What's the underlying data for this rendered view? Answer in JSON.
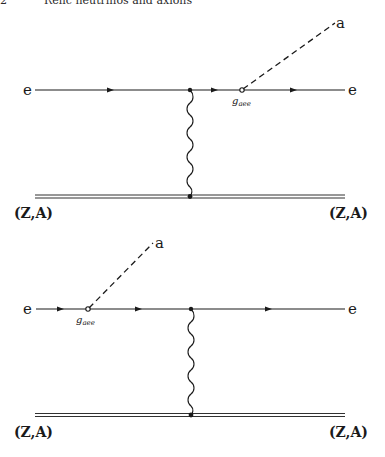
{
  "header": {
    "page_number": "2",
    "running_title": "Relic neutrinos and axions"
  },
  "diagrams": [
    {
      "id": "axion-emission-final-state",
      "incoming_electron": "e",
      "outgoing_electron": "e",
      "axion": "a",
      "coupling": "g",
      "coupling_sub": "aee",
      "nucleus_in": "(Z,A)",
      "nucleus_out": "(Z,A)"
    },
    {
      "id": "axion-emission-initial-state",
      "incoming_electron": "e",
      "outgoing_electron": "e",
      "axion": "a",
      "coupling": "g",
      "coupling_sub": "aee",
      "nucleus_in": "(Z,A)",
      "nucleus_out": "(Z,A)"
    }
  ],
  "colors": {
    "line": "#1a1a1a",
    "background": "#ffffff"
  }
}
